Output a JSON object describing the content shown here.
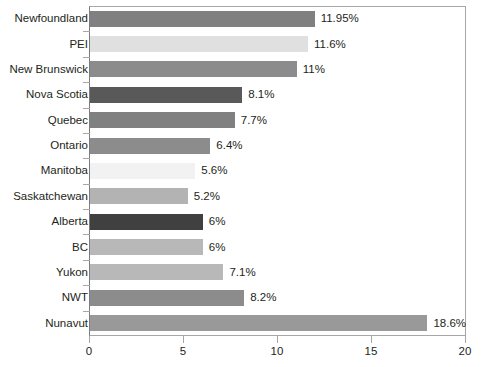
{
  "chart_data": {
    "type": "bar",
    "orientation": "horizontal",
    "title": "",
    "xlabel": "",
    "ylabel": "",
    "xlim": [
      0,
      20
    ],
    "xticks": [
      "0",
      "5",
      "10",
      "15",
      "20"
    ],
    "grid": false,
    "legend": "none",
    "value_suffix": "%",
    "categories": [
      "Newfoundland",
      "PEI",
      "New Brunswick",
      "Nova Scotia",
      "Quebec",
      "Ontario",
      "Manitoba",
      "Saskatchewan",
      "Alberta",
      "BC",
      "Yukon",
      "NWT",
      "Nunavut"
    ],
    "values": [
      11.95,
      11.6,
      11,
      8.1,
      7.7,
      6.4,
      5.6,
      5.2,
      6,
      6,
      7.1,
      8.2,
      18.6
    ],
    "value_labels": [
      "11.95%",
      "11.6%",
      "11%",
      "8.1%",
      "7.7%",
      "6.4%",
      "5.6%",
      "5.2%",
      "6%",
      "6%",
      "7.1%",
      "8.2%",
      "18.6%"
    ],
    "bar_colors": [
      "#808080",
      "#e0e0e0",
      "#8c8c8c",
      "#595959",
      "#808080",
      "#8c8c8c",
      "#f2f2f2",
      "#b3b3b3",
      "#404040",
      "#b8b8b8",
      "#b8b8b8",
      "#8c8c8c",
      "#999999"
    ],
    "axis_color": "#a7a7a7",
    "text_color": "#231f20",
    "background": "#ffffff"
  }
}
